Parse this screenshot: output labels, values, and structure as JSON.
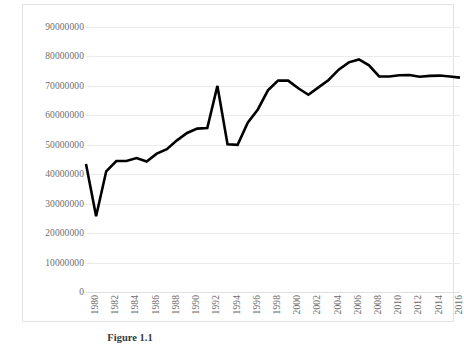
{
  "caption": "Figure 1.1",
  "chart_data": {
    "type": "line",
    "title": "",
    "subtitle": "",
    "xlabel": "",
    "ylabel": "",
    "grid": true,
    "legend": false,
    "legend_position": "none",
    "line_color": "#000000",
    "grid_color": "#eceaea",
    "border_color": "#e2e2e2",
    "label_color": "#6e6e6e",
    "xlim": [
      1980,
      2017
    ],
    "ylim": [
      0,
      90000000
    ],
    "ytick_step": 10000000,
    "xtick_step": 2,
    "ytick_labels": [
      "90000000",
      "80000000",
      "70000000",
      "60000000",
      "50000000",
      "40000000",
      "30000000",
      "20000000",
      "10000000",
      "0"
    ],
    "ytick_values": [
      90000000,
      80000000,
      70000000,
      60000000,
      50000000,
      40000000,
      30000000,
      20000000,
      10000000,
      0
    ],
    "xtick_labels": [
      "1980",
      "1982",
      "1984",
      "1986",
      "1988",
      "1990",
      "1992",
      "1994",
      "1996",
      "1998",
      "2000",
      "2002",
      "2004",
      "2006",
      "2008",
      "2010",
      "2012",
      "2014",
      "2016"
    ],
    "x": [
      1980,
      1981,
      1982,
      1983,
      1984,
      1985,
      1986,
      1987,
      1988,
      1989,
      1990,
      1991,
      1992,
      1993,
      1994,
      1995,
      1996,
      1997,
      1998,
      1999,
      2000,
      2001,
      2002,
      2003,
      2004,
      2005,
      2006,
      2007,
      2008,
      2009,
      2010,
      2011,
      2012,
      2013,
      2014,
      2015,
      2016,
      2017
    ],
    "values": [
      43500000,
      25700000,
      41000000,
      44500000,
      44500000,
      45500000,
      44300000,
      47000000,
      48500000,
      51500000,
      54000000,
      55500000,
      55700000,
      70000000,
      50200000,
      50000000,
      57500000,
      62000000,
      68500000,
      71800000,
      71800000,
      69200000,
      67000000,
      69500000,
      72000000,
      75500000,
      78000000,
      79000000,
      77000000,
      73200000,
      73200000,
      73600000,
      73700000,
      73100000,
      73400000,
      73500000,
      73200000,
      72800000
    ],
    "series": [
      {
        "name": "series-1",
        "values": [
          43500000,
          25700000,
          41000000,
          44500000,
          44500000,
          45500000,
          44300000,
          47000000,
          48500000,
          51500000,
          54000000,
          55500000,
          55700000,
          70000000,
          50200000,
          50000000,
          57500000,
          62000000,
          68500000,
          71800000,
          71800000,
          69200000,
          67000000,
          69500000,
          72000000,
          75500000,
          78000000,
          79000000,
          77000000,
          73200000,
          73200000,
          73600000,
          73700000,
          73100000,
          73400000,
          73500000,
          73200000,
          72800000
        ]
      }
    ]
  }
}
